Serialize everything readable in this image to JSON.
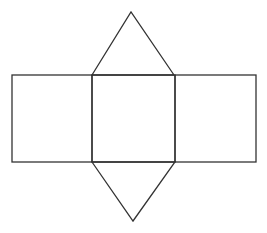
{
  "diagram": {
    "type": "net",
    "stroke_color": "#333333",
    "background": "#ffffff",
    "shapes": {
      "top_triangle": {
        "points": [
          [
            92,
            75
          ],
          [
            131,
            12
          ],
          [
            174,
            75
          ]
        ]
      },
      "left_rect": {
        "x": 12,
        "y": 75,
        "width": 80,
        "height": 87
      },
      "center_rect": {
        "x": 92,
        "y": 75,
        "width": 83,
        "height": 87
      },
      "right_rect": {
        "x": 175,
        "y": 75,
        "width": 81,
        "height": 87
      },
      "bottom_triangle": {
        "points": [
          [
            92,
            162
          ],
          [
            133,
            221
          ],
          [
            175,
            162
          ]
        ]
      }
    }
  }
}
